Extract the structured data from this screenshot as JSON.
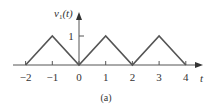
{
  "chart_data": {
    "type": "line",
    "title": "",
    "xlabel": "t",
    "ylabel": "v1(t)",
    "ylabel_main": "v",
    "ylabel_sub": "1",
    "ylabel_tail": "(t)",
    "caption": "(a)",
    "x": [
      -2,
      -1,
      0,
      1,
      2,
      3,
      4
    ],
    "series": [
      {
        "name": "v1(t)",
        "values": [
          0,
          1,
          0,
          1,
          0,
          1,
          0
        ]
      }
    ],
    "xticks": [
      "−2",
      "−1",
      "0",
      "1",
      "2",
      "3",
      "4"
    ],
    "yticks": [
      "1"
    ],
    "xlim": [
      -2.5,
      4.6
    ],
    "ylim": [
      0,
      1.6
    ],
    "grid": false,
    "legend": "none",
    "line_color": "#555555"
  }
}
